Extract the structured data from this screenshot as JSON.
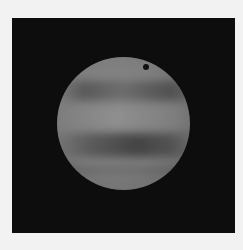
{
  "image": {
    "subject": "planet-with-bands-and-moon-shadow",
    "colors": {
      "background": "#f2f2f2",
      "space": "#0d0d0d",
      "planet": "#858585",
      "bands": "#4a4a4a",
      "moon_shadow": "#111111"
    }
  }
}
